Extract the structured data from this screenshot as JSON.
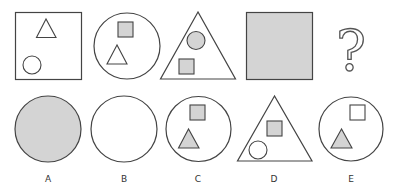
{
  "puzzle": {
    "type": "figure-series-reasoning",
    "colors": {
      "background": "#ffffff",
      "stroke": "#444444",
      "fill_gray": "#d4d4d4",
      "fill_white": "#ffffff"
    },
    "sequence": [
      {
        "position": 1,
        "outer": "square",
        "outer_fill": "white",
        "inner": [
          {
            "shape": "triangle",
            "fill": "white"
          },
          {
            "shape": "circle",
            "fill": "white"
          }
        ]
      },
      {
        "position": 2,
        "outer": "circle",
        "outer_fill": "white",
        "inner": [
          {
            "shape": "square",
            "fill": "gray"
          },
          {
            "shape": "triangle",
            "fill": "white"
          }
        ]
      },
      {
        "position": 3,
        "outer": "triangle",
        "outer_fill": "white",
        "inner": [
          {
            "shape": "circle",
            "fill": "gray"
          },
          {
            "shape": "square",
            "fill": "gray"
          }
        ]
      },
      {
        "position": 4,
        "outer": "square",
        "outer_fill": "gray",
        "inner": []
      },
      {
        "position": 5,
        "placeholder": "?"
      }
    ],
    "options": [
      {
        "label": "A",
        "outer": "circle",
        "outer_fill": "gray",
        "inner": []
      },
      {
        "label": "B",
        "outer": "circle",
        "outer_fill": "white",
        "inner": []
      },
      {
        "label": "C",
        "outer": "circle",
        "outer_fill": "white",
        "inner": [
          {
            "shape": "square",
            "fill": "gray"
          },
          {
            "shape": "triangle",
            "fill": "gray"
          }
        ]
      },
      {
        "label": "D",
        "outer": "triangle",
        "outer_fill": "white",
        "inner": [
          {
            "shape": "square",
            "fill": "gray"
          },
          {
            "shape": "circle",
            "fill": "white"
          }
        ]
      },
      {
        "label": "E",
        "outer": "circle",
        "outer_fill": "white",
        "inner": [
          {
            "shape": "square",
            "fill": "white"
          },
          {
            "shape": "triangle",
            "fill": "gray"
          }
        ]
      }
    ]
  }
}
